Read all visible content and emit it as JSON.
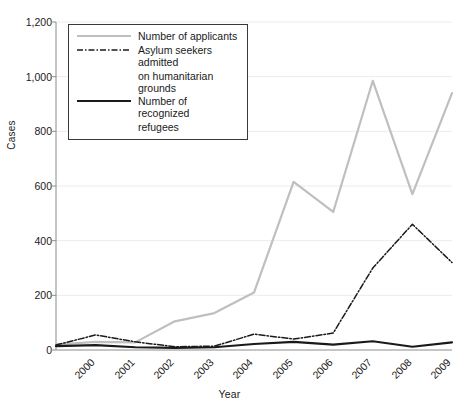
{
  "chart_data": {
    "type": "line",
    "title": "",
    "xlabel": "Year",
    "ylabel": "Cases",
    "categories": [
      "2000",
      "2001",
      "2002",
      "2003",
      "2004",
      "2005",
      "2006",
      "2007",
      "2008",
      "2009",
      "2010"
    ],
    "x": [
      2000,
      2001,
      2002,
      2003,
      2004,
      2005,
      2006,
      2007,
      2008,
      2009,
      2010
    ],
    "ylim": [
      0,
      1200
    ],
    "yticks": [
      "0",
      "200",
      "400",
      "600",
      "800",
      "1,000",
      "1,200"
    ],
    "ytick_values": [
      0,
      200,
      400,
      600,
      800,
      1000,
      1200
    ],
    "grid": true,
    "grid_axis": "y",
    "legend_position": "top-left",
    "series": [
      {
        "name": "Number of applicants",
        "style": "solid",
        "color": "#bfbfbf",
        "width": 2.2,
        "values": [
          20,
          30,
          28,
          105,
          135,
          210,
          615,
          505,
          985,
          570,
          940
        ]
      },
      {
        "name": "Asylum seekers admitted on humanitarian grounds",
        "style": "dash-dot",
        "color": "#1a1a1a",
        "width": 1.5,
        "values": [
          18,
          55,
          30,
          12,
          14,
          58,
          40,
          62,
          300,
          460,
          320
        ]
      },
      {
        "name": "Number of recognized refugees",
        "style": "solid",
        "color": "#1a1a1a",
        "width": 2.2,
        "values": [
          14,
          18,
          10,
          8,
          10,
          22,
          30,
          20,
          32,
          12,
          28
        ]
      }
    ]
  },
  "legend": {
    "items": [
      {
        "label": "Number of applicants",
        "cont": "",
        "key": "solid-gray"
      },
      {
        "label": "Asylum seekers admitted",
        "cont": "on humanitarian grounds",
        "key": "dashdot-black"
      },
      {
        "label": "Number of recognized",
        "cont": "refugees",
        "key": "solid-black"
      }
    ]
  },
  "colors": {
    "applicants": "#bfbfbf",
    "humanitarian": "#1a1a1a",
    "refugees": "#1a1a1a",
    "axis": "#8c8c8c",
    "grid": "#ececec"
  }
}
